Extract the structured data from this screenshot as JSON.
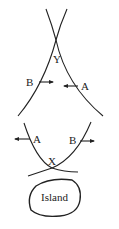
{
  "diagram": {
    "top_intersection_label": "Y",
    "bottom_intersection_label": "X",
    "top_labels": {
      "left": "B",
      "right": "A"
    },
    "bottom_labels": {
      "left": "A",
      "right": "B"
    },
    "island_label": "Island",
    "stroke_color": "#222222"
  }
}
